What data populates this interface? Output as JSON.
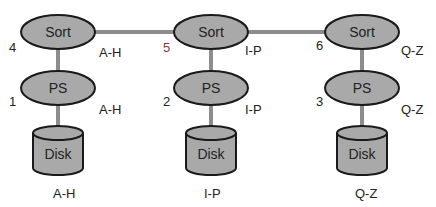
{
  "diagram": {
    "colors": {
      "node_fill": "#a9a9a9",
      "stroke": "#1a1a1a",
      "link": "#8c8c8c",
      "label": "#222222",
      "accent_label": "#8b3a2a"
    },
    "nodes": [
      {
        "id": "sort1",
        "label": "Sort",
        "type": "ellipse",
        "number": "4",
        "range": "A-H"
      },
      {
        "id": "sort2",
        "label": "Sort",
        "type": "ellipse",
        "number": "5",
        "range": "I-P"
      },
      {
        "id": "sort3",
        "label": "Sort",
        "type": "ellipse",
        "number": "6",
        "range": "Q-Z"
      },
      {
        "id": "ps1",
        "label": "PS",
        "type": "ellipse",
        "number": "1",
        "range": "A-H"
      },
      {
        "id": "ps2",
        "label": "PS",
        "type": "ellipse",
        "number": "2",
        "range": "I-P"
      },
      {
        "id": "ps3",
        "label": "PS",
        "type": "ellipse",
        "number": "3",
        "range": "Q-Z"
      },
      {
        "id": "disk1",
        "label": "Disk",
        "type": "cylinder",
        "range": "A-H"
      },
      {
        "id": "disk2",
        "label": "Disk",
        "type": "cylinder",
        "range": "I-P"
      },
      {
        "id": "disk3",
        "label": "Disk",
        "type": "cylinder",
        "range": "Q-Z"
      }
    ],
    "edges": [
      [
        "sort1",
        "sort2"
      ],
      [
        "sort2",
        "sort3"
      ],
      [
        "sort1",
        "ps1"
      ],
      [
        "sort2",
        "ps2"
      ],
      [
        "sort3",
        "ps3"
      ],
      [
        "ps1",
        "disk1"
      ],
      [
        "ps2",
        "disk2"
      ],
      [
        "ps3",
        "disk3"
      ]
    ]
  }
}
